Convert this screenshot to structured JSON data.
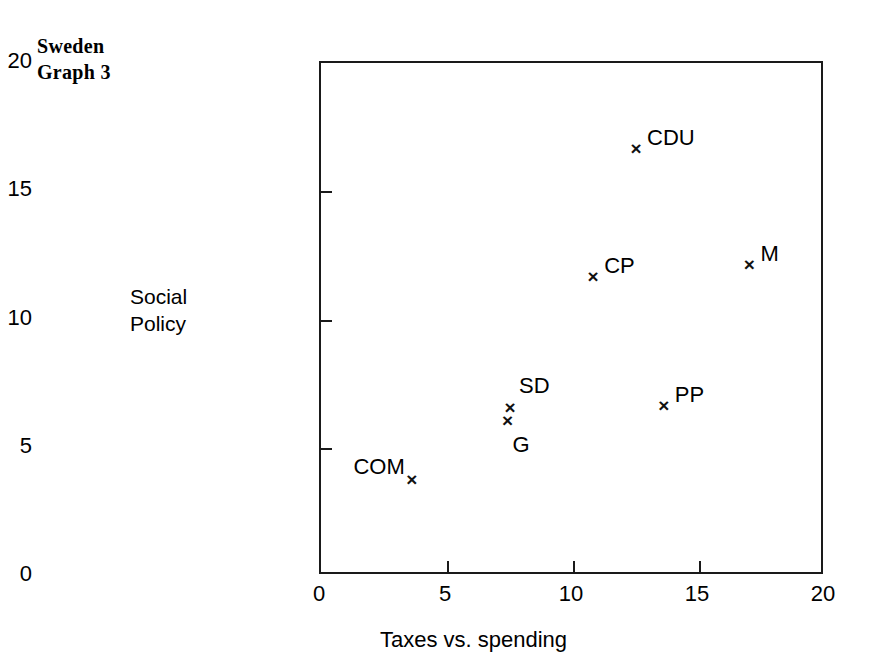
{
  "title": {
    "line1": "Sweden",
    "line2": "Graph 3"
  },
  "axes": {
    "y_label_line1": "Social",
    "y_label_line2": "Policy",
    "x_label": "Taxes vs. spending"
  },
  "chart_data": {
    "type": "scatter",
    "title": "Sweden Graph 3",
    "xlabel": "Taxes vs. spending",
    "ylabel": "Social Policy",
    "xlim": [
      0,
      20
    ],
    "ylim": [
      0,
      20
    ],
    "xticks": [
      "0",
      "5",
      "10",
      "15",
      "20"
    ],
    "yticks": [
      "0",
      "5",
      "10",
      "15",
      "20"
    ],
    "xtick_values": [
      0,
      5,
      10,
      15,
      20
    ],
    "ytick_values": [
      0,
      5,
      10,
      15,
      20
    ],
    "grid": false,
    "legend": "none",
    "marker": "x",
    "marker_color": "#111111",
    "points": [
      {
        "label": "CDU",
        "x": 12.5,
        "y": 16.6,
        "label_pos": "upper-right"
      },
      {
        "label": "M",
        "x": 17.0,
        "y": 12.1,
        "label_pos": "upper-right"
      },
      {
        "label": "CP",
        "x": 10.8,
        "y": 11.6,
        "label_pos": "upper-right"
      },
      {
        "label": "SD",
        "x": 7.5,
        "y": 6.5,
        "label_pos": "upper-above"
      },
      {
        "label": "PP",
        "x": 13.6,
        "y": 6.6,
        "label_pos": "upper-right"
      },
      {
        "label": "G",
        "x": 7.4,
        "y": 6.0,
        "label_pos": "below"
      },
      {
        "label": "COM",
        "x": 3.6,
        "y": 3.7,
        "label_pos": "upper-left"
      }
    ]
  }
}
